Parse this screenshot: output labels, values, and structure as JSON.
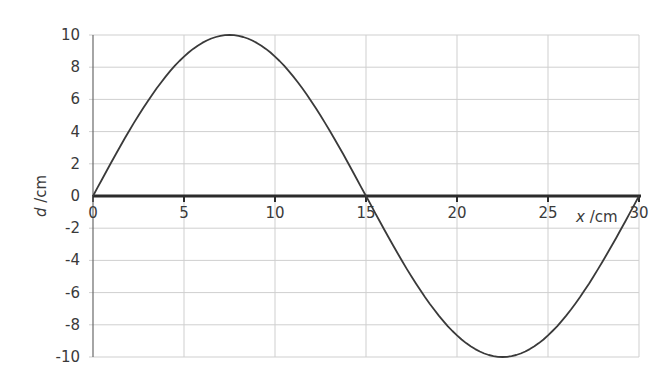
{
  "chart_data": {
    "type": "line",
    "title": "",
    "xlabel": "x /cm",
    "ylabel": "d /cm",
    "xlim": [
      0,
      30
    ],
    "ylim": [
      -10,
      10
    ],
    "grid": true,
    "legend": null,
    "x_ticks": [
      0,
      5,
      10,
      15,
      20,
      25,
      30
    ],
    "y_ticks": [
      10,
      8,
      6,
      4,
      2,
      0,
      -2,
      -4,
      -6,
      -8,
      -10
    ],
    "series": [
      {
        "name": "displacement",
        "x": [
          0,
          2.5,
          5,
          7.5,
          10,
          12.5,
          15,
          17.5,
          20,
          22.5,
          25,
          27.5,
          30
        ],
        "values": [
          0,
          5,
          8.66,
          10,
          8.66,
          5,
          0,
          -5,
          -8.66,
          -10,
          -8.66,
          -5,
          0
        ]
      }
    ],
    "colors": {
      "line": "#3a3a3a",
      "axis": "#2b2b2b",
      "grid": "#cfcfcf",
      "text": "#3a3a3a"
    }
  }
}
